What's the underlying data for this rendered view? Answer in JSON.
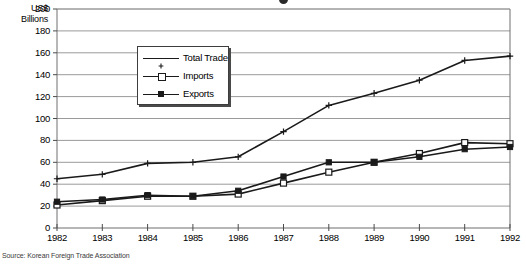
{
  "figure": {
    "source_note": "Source: Korean Foreign Trade Association",
    "unit_label_line1": "US$",
    "unit_label_line2": "Billions"
  },
  "chart_data": {
    "type": "line",
    "title": "",
    "xlabel": "",
    "ylabel": "US$ Billions",
    "ylim": [
      0,
      200
    ],
    "ytick_step": 20,
    "grid": true,
    "legend_position": "upper-left-inside",
    "categories": [
      "1982",
      "1983",
      "1984",
      "1985",
      "1986",
      "1987",
      "1988",
      "1989",
      "1990",
      "1991",
      "1992"
    ],
    "yticks": [
      "0",
      "20",
      "40",
      "60",
      "80",
      "100",
      "120",
      "140",
      "160",
      "180",
      "200"
    ],
    "series": [
      {
        "name": "Total Trade",
        "marker": "plus",
        "values": [
          45,
          49,
          59,
          60,
          65,
          88,
          112,
          123,
          135,
          153,
          157
        ]
      },
      {
        "name": "Imports",
        "marker": "open-square",
        "values": [
          21,
          25,
          29,
          29,
          31,
          41,
          51,
          60,
          68,
          78,
          77
        ]
      },
      {
        "name": "Exports",
        "marker": "filled-square",
        "values": [
          24,
          26,
          30,
          29,
          34,
          47,
          60,
          60,
          65,
          72,
          74
        ]
      }
    ]
  }
}
